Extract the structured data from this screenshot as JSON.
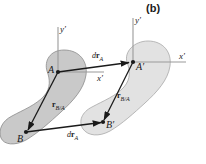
{
  "figure": {
    "panel_label": "(b)",
    "background_color": "#ffffff",
    "body_fill_left": "#c9c9c9",
    "body_fill_right": "#e2e2e2",
    "body_stroke": "#8c8c8c",
    "vector_color": "#1a1a1a",
    "axis_color": "#9a9a9a"
  },
  "labels": {
    "point_a": "A",
    "point_a_prime": "A′",
    "point_b": "B",
    "point_b_prime": "B′",
    "axis_y_left": "y′",
    "axis_y_right": "y′",
    "axis_x_left": "x′",
    "axis_x_right": "x′"
  },
  "vectors": {
    "dr_a_top": {
      "symbol_d": "d",
      "symbol_r": "r",
      "subscript": "A"
    },
    "dr_a_bottom": {
      "symbol_d": "d",
      "symbol_r": "r",
      "subscript": "A"
    },
    "r_ba_left": {
      "symbol_r": "r",
      "subscript": "B/A"
    },
    "r_ba_right": {
      "symbol_r": "r",
      "subscript": "B/A"
    }
  }
}
